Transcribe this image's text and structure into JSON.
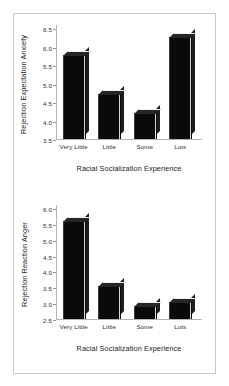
{
  "figure": {
    "background": "#ffffff",
    "frame_color": "#c9c9c9",
    "bar_color": "#0a0a0a",
    "axis_color": "#b3b3b3"
  },
  "chart_data": [
    {
      "type": "bar",
      "title": "",
      "panel": "top",
      "categories": [
        "Very Little",
        "Little",
        "Some",
        "Lots"
      ],
      "values": [
        5.78,
        4.72,
        4.2,
        6.27
      ],
      "xlabel": "Racial Socialization Experience",
      "ylabel": "Rejection Expectation Anxiety",
      "ylim": [
        3.5,
        6.5
      ],
      "yticks": [
        3.5,
        4.0,
        4.5,
        5.0,
        5.5,
        6.0,
        6.5
      ],
      "ytick_labels": [
        "3.5",
        "4.0",
        "4.5",
        "5.0",
        "5.5",
        "6.0",
        "6.5"
      ],
      "grid": false,
      "legend": null
    },
    {
      "type": "bar",
      "title": "",
      "panel": "bottom",
      "categories": [
        "Very Little",
        "Little",
        "Some",
        "Lots"
      ],
      "values": [
        5.6,
        3.55,
        2.9,
        3.05
      ],
      "xlabel": "Racial Socialization Experience",
      "ylabel": "Rejection Reaction Anger",
      "ylim": [
        2.5,
        6.0
      ],
      "yticks": [
        2.5,
        3.0,
        3.5,
        4.0,
        4.5,
        5.0,
        5.5,
        6.0
      ],
      "ytick_labels": [
        "2.5",
        "3.0",
        "3.5",
        "4.0",
        "4.5",
        "5.0",
        "5.5",
        "6.0"
      ],
      "grid": false,
      "legend": null
    }
  ]
}
